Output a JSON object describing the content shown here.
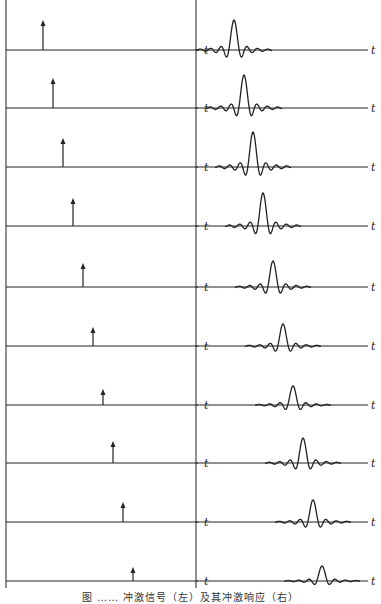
{
  "figure": {
    "caption": "图 …… 冲激信号（左）及其冲激响应（右）",
    "axis_label": "t",
    "stroke_color": "#222222",
    "background": "#ffffff"
  },
  "layout": {
    "left_panel_x": [
      6,
      200
    ],
    "right_panel_x": [
      196,
      372
    ],
    "left_label_x": 205,
    "right_label_x": 372
  },
  "rows": [
    {
      "baseline_y": 50,
      "impulse_x": 43,
      "impulse_height": 30,
      "response_peak_x": 234,
      "response_amplitude": 30
    },
    {
      "baseline_y": 108,
      "impulse_x": 53,
      "impulse_height": 30,
      "response_peak_x": 244,
      "response_amplitude": 33
    },
    {
      "baseline_y": 167,
      "impulse_x": 63,
      "impulse_height": 29,
      "response_peak_x": 253,
      "response_amplitude": 35
    },
    {
      "baseline_y": 226,
      "impulse_x": 73,
      "impulse_height": 28,
      "response_peak_x": 263,
      "response_amplitude": 33
    },
    {
      "baseline_y": 287,
      "impulse_x": 83,
      "impulse_height": 24,
      "response_peak_x": 273,
      "response_amplitude": 26
    },
    {
      "baseline_y": 346,
      "impulse_x": 93,
      "impulse_height": 19,
      "response_peak_x": 283,
      "response_amplitude": 22
    },
    {
      "baseline_y": 405,
      "impulse_x": 103,
      "impulse_height": 16,
      "response_peak_x": 293,
      "response_amplitude": 19
    },
    {
      "baseline_y": 463,
      "impulse_x": 113,
      "impulse_height": 22,
      "response_peak_x": 303,
      "response_amplitude": 25
    },
    {
      "baseline_y": 522,
      "impulse_x": 123,
      "impulse_height": 20,
      "response_peak_x": 313,
      "response_amplitude": 22
    },
    {
      "baseline_y": 581,
      "impulse_x": 133,
      "impulse_height": 14,
      "response_peak_x": 322,
      "response_amplitude": 15
    }
  ]
}
